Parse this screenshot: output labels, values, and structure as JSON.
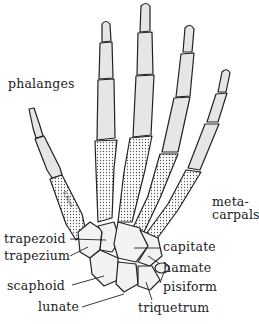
{
  "diagram": {
    "colors": {
      "background": "#ffffff",
      "ink": "#222222",
      "phalanx_fill": "#e6e6e6",
      "metacarpal_fill": "#d8d8d8",
      "carpal_fill": "#f2f2f2"
    },
    "labels": {
      "phalanges": "phalanges",
      "metacarpals_line1": "meta-",
      "metacarpals_line2": "carpals",
      "trapezoid": "trapezoid",
      "trapezium": "trapezium",
      "scaphoid": "scaphoid",
      "lunate": "lunate",
      "capitate": "capitate",
      "hamate": "hamate",
      "pisiform": "pisiform",
      "triquetrum": "triquetrum"
    },
    "signature": "S.Ross"
  }
}
